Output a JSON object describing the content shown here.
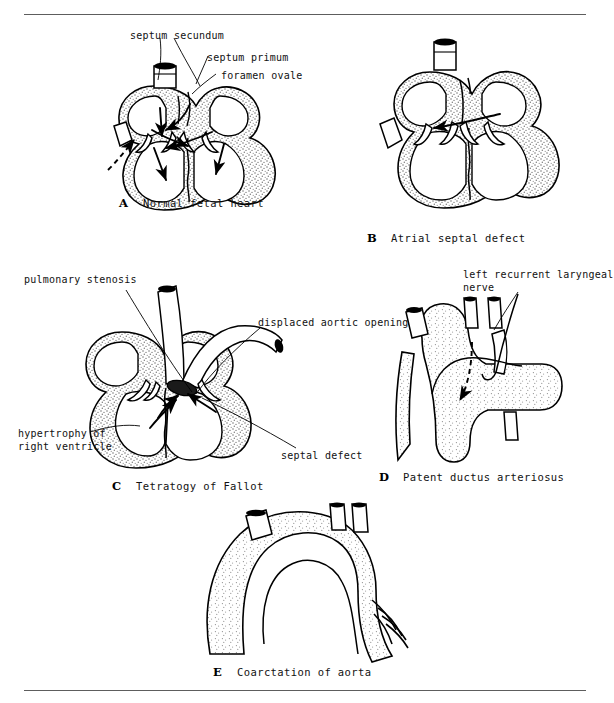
{
  "page": {
    "kind": "textbook-figure-plate",
    "panel_count": 5,
    "top_rule": true,
    "bottom_rule": true
  },
  "panels": [
    {
      "id": "A",
      "letter": "A",
      "title": "Normal fetal heart",
      "labels": [
        {
          "name": "septum-secundum",
          "text": "septum secundum"
        },
        {
          "name": "septum-primum",
          "text": "septum primum"
        },
        {
          "name": "foramen-ovale",
          "text": "foramen ovale"
        }
      ]
    },
    {
      "id": "B",
      "letter": "B",
      "title": "Atrial septal defect",
      "labels": []
    },
    {
      "id": "C",
      "letter": "C",
      "title": "Tetratogy of Fallot",
      "labels": [
        {
          "name": "pulmonary-stenosis",
          "text": "pulmonary stenosis"
        },
        {
          "name": "displaced-aortic-opening",
          "text": "displaced aortic opening"
        },
        {
          "name": "hypertrophy-right-ventricle",
          "text": "hypertrophy of\nright ventricle"
        },
        {
          "name": "septal-defect",
          "text": "septal defect"
        }
      ]
    },
    {
      "id": "D",
      "letter": "D",
      "title": "Patent ductus arteriosus",
      "labels": [
        {
          "name": "left-recurrent-laryngeal-nerve",
          "text": "left recurrent laryngeal\nnerve"
        }
      ]
    },
    {
      "id": "E",
      "letter": "E",
      "title": "Coarctation of aorta",
      "labels": []
    }
  ],
  "colors": {
    "ink": "#000000",
    "rule": "#5d5d5d",
    "background": "#ffffff",
    "stipple": "#7a7a7a"
  }
}
